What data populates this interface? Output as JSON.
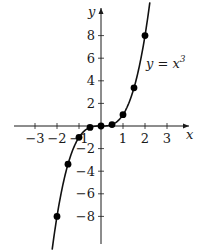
{
  "chart_data": {
    "type": "line",
    "title": "",
    "xlabel": "x",
    "ylabel": "y",
    "curve_label": "y = x^3",
    "function": "x^3",
    "xlim": [
      -4.5,
      4.5
    ],
    "ylim": [
      -11,
      11
    ],
    "grid": false,
    "x_ticks": [
      -3,
      -2,
      -1,
      1,
      2,
      3
    ],
    "y_ticks": [
      -8,
      -6,
      -4,
      -2,
      2,
      4,
      6,
      8
    ],
    "x_tick_labels": [
      "−3",
      "−2",
      "−1",
      "1",
      "2",
      "3"
    ],
    "y_tick_labels": [
      "−8",
      "−6",
      "−4",
      "−2",
      "2",
      "4",
      "6",
      "8"
    ],
    "points": [
      {
        "x": -2,
        "y": -8
      },
      {
        "x": -1.5,
        "y": -3.375
      },
      {
        "x": -1,
        "y": -1
      },
      {
        "x": -0.5,
        "y": -0.125
      },
      {
        "x": 0,
        "y": 0
      },
      {
        "x": 0.5,
        "y": 0.125
      },
      {
        "x": 1,
        "y": 1
      },
      {
        "x": 1.5,
        "y": 3.375
      },
      {
        "x": 2,
        "y": 8
      }
    ],
    "series": [
      {
        "name": "y = x^3",
        "x": [
          -2,
          -1.5,
          -1,
          -0.5,
          0,
          0.5,
          1,
          1.5,
          2
        ],
        "values": [
          -8,
          -3.375,
          -1,
          -0.125,
          0,
          0.125,
          1,
          3.375,
          8
        ]
      }
    ]
  },
  "labels": {
    "x_axis": "x",
    "y_axis": "y",
    "curve_prefix": "y = x",
    "curve_exp": "3"
  },
  "colors": {
    "axis": "#1a1a1a",
    "curve": "#111111",
    "point": "#000000"
  }
}
